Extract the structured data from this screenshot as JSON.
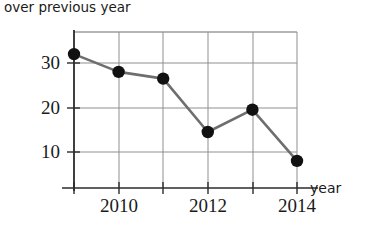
{
  "caption": {
    "line_clipped": "percent change",
    "line_visible": "over previous year"
  },
  "axis": {
    "x_title": "year",
    "y_ticks": [
      "30",
      "20",
      "10"
    ],
    "x_ticks": [
      "2010",
      "2012",
      "2014"
    ]
  },
  "colors": {
    "ink": "#1a1a1a",
    "grid": "#8a8a8a",
    "axis": "#2b2b2b",
    "line": "#6e6e6e",
    "marker": "#111111",
    "background": "#ffffff"
  },
  "chart_data": {
    "type": "line",
    "title": "over previous year",
    "xlabel": "year",
    "ylabel": "",
    "x": [
      2009,
      2010,
      2011,
      2012,
      2013,
      2014
    ],
    "values": [
      32,
      28,
      26.5,
      14.5,
      19.5,
      8
    ],
    "series": [
      {
        "name": "percent change over previous year",
        "values": [
          32,
          28,
          26.5,
          14.5,
          19.5,
          8
        ]
      }
    ],
    "xlim": [
      2009,
      2014
    ],
    "ylim": [
      0,
      35
    ],
    "x_tick_values": [
      2010,
      2012,
      2014
    ],
    "y_tick_values": [
      10,
      20,
      30
    ],
    "grid": true,
    "legend": "none",
    "markers": "filled-circle"
  }
}
